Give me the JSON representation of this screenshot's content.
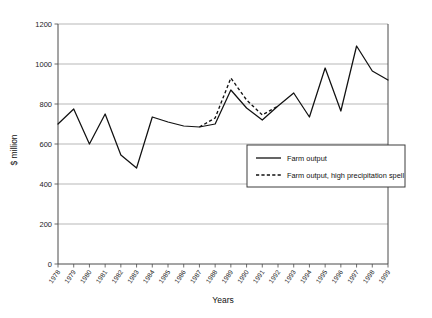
{
  "chart_data": {
    "type": "line",
    "title": "",
    "xlabel": "Years",
    "ylabel": "$ million",
    "ylim": [
      0,
      1200
    ],
    "ytick_step": 200,
    "yticks": [
      "0",
      "200",
      "400",
      "600",
      "800",
      "1000",
      "1200"
    ],
    "grid": true,
    "legend_position": "inside-center-right",
    "categories": [
      "1978",
      "1979",
      "1980",
      "1981",
      "1982",
      "1983",
      "1984",
      "1985",
      "1986",
      "1987",
      "1988",
      "1989",
      "1990",
      "1991",
      "1992",
      "1993",
      "1994",
      "1995",
      "1996",
      "1997",
      "1998",
      "1999"
    ],
    "series": [
      {
        "name": "Farm output",
        "style": "solid",
        "color": "#111111",
        "values": [
          700,
          775,
          600,
          750,
          545,
          480,
          735,
          710,
          690,
          685,
          700,
          870,
          780,
          720,
          790,
          855,
          735,
          980,
          765,
          1090,
          965,
          920
        ]
      },
      {
        "name": "Farm output, high precipitation spell",
        "style": "dashed",
        "color": "#111111",
        "start_category": "1987",
        "end_category": "1992",
        "values": [
          null,
          null,
          null,
          null,
          null,
          null,
          null,
          null,
          null,
          685,
          730,
          930,
          820,
          745,
          790,
          null,
          null,
          null,
          null,
          null,
          null,
          null
        ]
      }
    ]
  },
  "legend": {
    "entries": [
      {
        "label": "Farm output",
        "style": "solid"
      },
      {
        "label": "Farm output, high precipitation spell",
        "style": "dashed"
      }
    ]
  }
}
